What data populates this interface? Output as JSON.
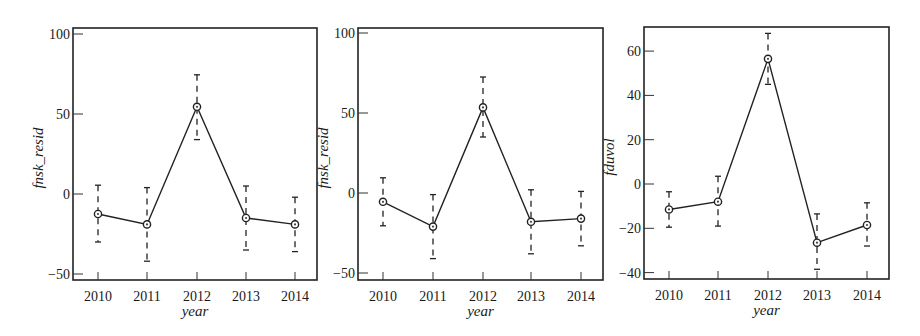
{
  "chart_data": [
    {
      "type": "line",
      "panel": "left",
      "title": "",
      "xlabel": "year",
      "ylabel": "fnsk_resid",
      "categories": [
        "2010",
        "2011",
        "2012",
        "2013",
        "2014"
      ],
      "values": [
        -12.5,
        -19,
        54.5,
        -15,
        -19
      ],
      "error_upper": [
        5.5,
        4,
        74.5,
        5,
        -2
      ],
      "error_lower": [
        -30,
        -42,
        34,
        -35,
        -36
      ],
      "yticks": [
        -50,
        0,
        50,
        100
      ],
      "ylim": [
        -54,
        104
      ],
      "grid": false,
      "legend": null,
      "frame": {
        "left": 73,
        "right": 317,
        "top": 28,
        "bottom": 280
      },
      "xpos": [
        98,
        147,
        197,
        246,
        295
      ],
      "ypx": {
        "ref_val": 0,
        "ref_px": 194,
        "px_per_unit": 1.6
      }
    },
    {
      "type": "line",
      "panel": "middle",
      "title": "",
      "xlabel": "year",
      "ylabel": "fnsk_resid",
      "categories": [
        "2010",
        "2011",
        "2012",
        "2013",
        "2014"
      ],
      "values": [
        -5.5,
        -21,
        53.5,
        -18,
        -16
      ],
      "error_upper": [
        9.5,
        -1,
        72.5,
        2,
        1
      ],
      "error_lower": [
        -20.5,
        -41,
        35,
        -38,
        -33
      ],
      "yticks": [
        -50,
        0,
        50,
        100
      ],
      "ylim": [
        -54,
        104
      ],
      "grid": false,
      "legend": null,
      "frame": {
        "left": 358,
        "right": 603,
        "top": 28,
        "bottom": 280
      },
      "xpos": [
        383,
        433,
        483,
        531,
        581
      ],
      "ypx": {
        "ref_val": 0,
        "ref_px": 193,
        "px_per_unit": 1.6
      }
    },
    {
      "type": "line",
      "panel": "right",
      "title": "",
      "xlabel": "year",
      "ylabel": "fduvol",
      "categories": [
        "2010",
        "2011",
        "2012",
        "2013",
        "2014"
      ],
      "values": [
        -11.5,
        -8,
        56.5,
        -26.5,
        -18.5
      ],
      "error_upper": [
        -3.5,
        3.5,
        68,
        -13.5,
        -8.5
      ],
      "error_lower": [
        -19.5,
        -19,
        45,
        -38.5,
        -28
      ],
      "yticks": [
        -40,
        -20,
        0,
        20,
        40,
        60
      ],
      "ylim": [
        -43,
        71
      ],
      "grid": false,
      "legend": null,
      "frame": {
        "left": 644,
        "right": 889,
        "top": 27,
        "bottom": 279
      },
      "xpos": [
        669,
        718,
        768,
        817,
        867
      ],
      "ypx": {
        "ref_val": 0,
        "ref_px": 184,
        "px_per_unit": 2.215
      }
    }
  ]
}
